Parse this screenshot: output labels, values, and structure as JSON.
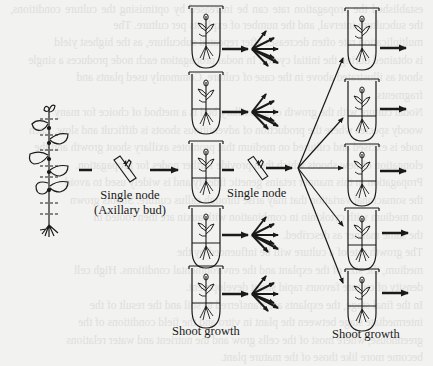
{
  "figure": {
    "labels": {
      "single_node_axillary_line1": "Single node",
      "single_node_axillary_line2": "(Axillary bud)",
      "single_node_middle": "Single node",
      "shoot_growth_left": "Shoot growth",
      "shoot_growth_right": "Shoot growth"
    },
    "stages": [
      "mother-plant",
      "single-node-explant",
      "culture-tube-column-1",
      "shoot-multiplication",
      "single-node-subculture",
      "culture-tube-column-2"
    ],
    "column1_tube_count": 5,
    "column2_tube_count": 5,
    "colors": {
      "ink": "#1a1a1a",
      "paper": "#f2f2f0",
      "bleed_text": "#cfcfcc"
    }
  },
  "bleed_text": [
    "established the propagation rate can be increased by optimising the culture conditions, the subculture interval, and the number of explants per culture. The",
    "multiplication rate often decreases after repeated subculture, as the highest yield",
    "is obtained during the initial cycles. In nodal propagation each node produces a single",
    "shoot as illustrated above in the case of culture. Commonly used plants and",
    "fragments.",
    "Nodal culture with the growth of an axillary bud is a method of choice for many",
    "woody species where the production of adventitious shoots is difficult and slow. Each",
    "node is excised and cultured on medium that promotes axillary shoot growth and the",
    "elongation of new shoots which then provide further nodes for propagation.",
    "Propagation in this manner retains genetic fidelity and is widely used to avoid",
    "the somaclonal variation that may arise through callus culture. Shoots grown",
    "on medium with cytokinin in combination with auxin are then rooted in",
    "the same manner as described.",
    "The growth rate of a culture will be influenced by the",
    "medium, the size of the explant and the environmental conditions. High cell",
    "density of culture favours rapid shoot development.",
    "In the final stage, the explants are transferred to soil and the result of the",
    "intermediate stage between the plant in vitro and the field conditions of the",
    "greenhouse, where most of the cells grow and the nutrient and water relations",
    "become more like those of the mature plant."
  ]
}
